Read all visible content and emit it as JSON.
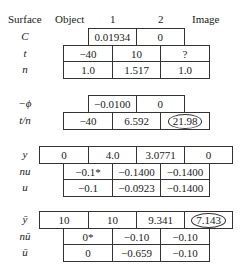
{
  "header": {
    "surface": "Surface",
    "object": "Object",
    "s1": "1",
    "s2": "2",
    "image": "Image"
  },
  "labels": {
    "C": "C",
    "t": "t",
    "n": "n",
    "neg_phi": "−ϕ",
    "t_over_n": "t/n",
    "y": "y",
    "nu": "nu",
    "u": "u",
    "ybar": "ȳ",
    "nubar": "nū",
    "ubar": "ū"
  },
  "block1": {
    "C": [
      "0.01934",
      "0"
    ],
    "t": [
      "−40",
      "10",
      "?"
    ],
    "n": [
      "1.0",
      "1.517",
      "1.0"
    ]
  },
  "block2": {
    "neg_phi": [
      "−0.0100",
      "0"
    ],
    "t_over_n": [
      "−40",
      "6.592",
      "21.98"
    ]
  },
  "block3": {
    "y": [
      "0",
      "4.0",
      "3.0771",
      "0"
    ],
    "nu": [
      "−0.1*",
      "−0.1400",
      "−0.1400"
    ],
    "u": [
      "−0.1",
      "−0.0923",
      "−0.1400"
    ]
  },
  "block4": {
    "ybar": [
      "10",
      "10",
      "9.341",
      "7.143"
    ],
    "nubar": [
      "0*",
      "−0.10",
      "−0.10"
    ],
    "ubar": [
      "0",
      "−0.659",
      "−0.10"
    ]
  }
}
